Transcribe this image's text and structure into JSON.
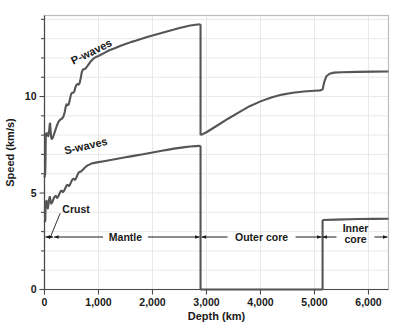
{
  "chart_data": {
    "type": "line",
    "title": "",
    "xlabel": "Depth (km)",
    "ylabel": "Speed (km/s)",
    "xlim": [
      0,
      6371
    ],
    "ylim": [
      0,
      14.2
    ],
    "grid": true,
    "legend": "inline-curve-labels",
    "x_ticks": [
      {
        "value": 0,
        "label": "0"
      },
      {
        "value": 1000,
        "label": "1,000"
      },
      {
        "value": 2000,
        "label": "2,000"
      },
      {
        "value": 3000,
        "label": "3,000"
      },
      {
        "value": 4000,
        "label": "4,000"
      },
      {
        "value": 5000,
        "label": "5,000"
      },
      {
        "value": 6000,
        "label": "6,000"
      }
    ],
    "y_ticks": [
      {
        "value": 0,
        "label": "0"
      },
      {
        "value": 1,
        "label": ""
      },
      {
        "value": 2,
        "label": ""
      },
      {
        "value": 3,
        "label": ""
      },
      {
        "value": 4,
        "label": ""
      },
      {
        "value": 5,
        "label": "5"
      },
      {
        "value": 6,
        "label": ""
      },
      {
        "value": 7,
        "label": ""
      },
      {
        "value": 8,
        "label": ""
      },
      {
        "value": 9,
        "label": ""
      },
      {
        "value": 10,
        "label": "10"
      },
      {
        "value": 11,
        "label": ""
      },
      {
        "value": 12,
        "label": ""
      },
      {
        "value": 13,
        "label": ""
      },
      {
        "value": 14,
        "label": ""
      }
    ],
    "series": [
      {
        "name": "P-waves",
        "label": "P-waves",
        "color": "#555555",
        "label_x": 900,
        "label_y": 12.15,
        "label_rotation": -26,
        "segments": [
          {
            "region": "crust-mantle",
            "points": [
              [
                0,
                5.8
              ],
              [
                12,
                6.0
              ],
              [
                18,
                6.5
              ],
              [
                22,
                7.6
              ],
              [
                26,
                8.05
              ],
              [
                40,
                8.1
              ],
              [
                55,
                8.0
              ],
              [
                70,
                7.95
              ],
              [
                85,
                8.2
              ],
              [
                96,
                8.55
              ],
              [
                104,
                8.6
              ],
              [
                112,
                8.3
              ],
              [
                122,
                7.9
              ],
              [
                134,
                7.8
              ],
              [
                150,
                7.85
              ],
              [
                170,
                8.0
              ],
              [
                200,
                8.25
              ],
              [
                230,
                8.5
              ],
              [
                260,
                8.7
              ],
              [
                290,
                8.8
              ],
              [
                320,
                8.85
              ],
              [
                350,
                8.95
              ],
              [
                375,
                9.2
              ],
              [
                395,
                9.5
              ],
              [
                410,
                9.6
              ],
              [
                430,
                9.55
              ],
              [
                450,
                9.6
              ],
              [
                470,
                9.85
              ],
              [
                490,
                10.1
              ],
              [
                510,
                10.2
              ],
              [
                530,
                10.2
              ],
              [
                550,
                10.25
              ],
              [
                570,
                10.45
              ],
              [
                590,
                10.6
              ],
              [
                610,
                10.65
              ],
              [
                630,
                10.62
              ],
              [
                650,
                10.7
              ],
              [
                670,
                10.95
              ],
              [
                690,
                11.25
              ],
              [
                710,
                11.4
              ],
              [
                730,
                11.42
              ],
              [
                760,
                11.45
              ],
              [
                800,
                11.6
              ],
              [
                850,
                11.8
              ],
              [
                900,
                11.95
              ],
              [
                950,
                12.05
              ],
              [
                1000,
                12.1
              ],
              [
                1100,
                12.25
              ],
              [
                1200,
                12.4
              ],
              [
                1300,
                12.5
              ],
              [
                1400,
                12.62
              ],
              [
                1500,
                12.72
              ],
              [
                1600,
                12.82
              ],
              [
                1700,
                12.9
              ],
              [
                1800,
                13.0
              ],
              [
                1900,
                13.08
              ],
              [
                2000,
                13.16
              ],
              [
                2100,
                13.24
              ],
              [
                2200,
                13.32
              ],
              [
                2300,
                13.4
              ],
              [
                2400,
                13.47
              ],
              [
                2500,
                13.55
              ],
              [
                2600,
                13.62
              ],
              [
                2700,
                13.68
              ],
              [
                2800,
                13.72
              ],
              [
                2890,
                13.75
              ]
            ]
          },
          {
            "region": "outer-core",
            "points": [
              [
                2890,
                8.0
              ],
              [
                3000,
                8.15
              ],
              [
                3200,
                8.5
              ],
              [
                3400,
                8.85
              ],
              [
                3600,
                9.18
              ],
              [
                3800,
                9.5
              ],
              [
                4000,
                9.75
              ],
              [
                4200,
                9.95
              ],
              [
                4400,
                10.1
              ],
              [
                4600,
                10.2
              ],
              [
                4800,
                10.26
              ],
              [
                5000,
                10.3
              ],
              [
                5100,
                10.32
              ],
              [
                5150,
                10.35
              ]
            ]
          },
          {
            "region": "inner-core",
            "points": [
              [
                5150,
                10.35
              ],
              [
                5180,
                10.75
              ],
              [
                5220,
                11.05
              ],
              [
                5280,
                11.18
              ],
              [
                5360,
                11.24
              ],
              [
                5500,
                11.26
              ],
              [
                5800,
                11.28
              ],
              [
                6100,
                11.29
              ],
              [
                6371,
                11.3
              ]
            ]
          }
        ],
        "discontinuities": [
          {
            "depth": 2890,
            "from": 13.75,
            "to": 8.0,
            "name": "core-mantle-boundary"
          }
        ]
      },
      {
        "name": "S-waves",
        "label": "S-waves",
        "color": "#555555",
        "label_x": 780,
        "label_y": 7.25,
        "label_rotation": -13,
        "segments": [
          {
            "region": "crust-mantle",
            "points": [
              [
                0,
                3.5
              ],
              [
                14,
                3.55
              ],
              [
                20,
                4.3
              ],
              [
                26,
                4.55
              ],
              [
                38,
                4.6
              ],
              [
                50,
                4.35
              ],
              [
                62,
                4.2
              ],
              [
                76,
                4.45
              ],
              [
                90,
                4.75
              ],
              [
                100,
                4.8
              ],
              [
                112,
                4.6
              ],
              [
                124,
                4.45
              ],
              [
                140,
                4.5
              ],
              [
                160,
                4.65
              ],
              [
                185,
                4.8
              ],
              [
                210,
                4.85
              ],
              [
                230,
                4.75
              ],
              [
                250,
                4.8
              ],
              [
                275,
                4.95
              ],
              [
                300,
                5.1
              ],
              [
                320,
                5.12
              ],
              [
                340,
                5.05
              ],
              [
                360,
                5.1
              ],
              [
                385,
                5.25
              ],
              [
                410,
                5.4
              ],
              [
                430,
                5.42
              ],
              [
                450,
                5.36
              ],
              [
                470,
                5.42
              ],
              [
                495,
                5.58
              ],
              [
                520,
                5.72
              ],
              [
                540,
                5.74
              ],
              [
                560,
                5.68
              ],
              [
                580,
                5.74
              ],
              [
                605,
                5.9
              ],
              [
                630,
                6.05
              ],
              [
                650,
                6.1
              ],
              [
                670,
                6.1
              ],
              [
                700,
                6.18
              ],
              [
                740,
                6.3
              ],
              [
                790,
                6.42
              ],
              [
                850,
                6.5
              ],
              [
                900,
                6.55
              ],
              [
                1000,
                6.6
              ],
              [
                1100,
                6.65
              ],
              [
                1200,
                6.7
              ],
              [
                1300,
                6.75
              ],
              [
                1400,
                6.8
              ],
              [
                1500,
                6.85
              ],
              [
                1600,
                6.9
              ],
              [
                1700,
                6.95
              ],
              [
                1800,
                7.0
              ],
              [
                1900,
                7.05
              ],
              [
                2000,
                7.1
              ],
              [
                2100,
                7.15
              ],
              [
                2200,
                7.2
              ],
              [
                2300,
                7.25
              ],
              [
                2400,
                7.3
              ],
              [
                2500,
                7.34
              ],
              [
                2600,
                7.38
              ],
              [
                2700,
                7.41
              ],
              [
                2800,
                7.43
              ],
              [
                2890,
                7.45
              ]
            ]
          },
          {
            "region": "outer-core",
            "points": [
              [
                2890,
                0
              ],
              [
                5150,
                0
              ]
            ]
          },
          {
            "region": "inner-core",
            "points": [
              [
                5150,
                3.6
              ],
              [
                5400,
                3.62
              ],
              [
                5800,
                3.65
              ],
              [
                6100,
                3.66
              ],
              [
                6371,
                3.67
              ]
            ]
          }
        ],
        "discontinuities": [
          {
            "depth": 2890,
            "from": 7.45,
            "to": 0,
            "name": "core-mantle-boundary"
          },
          {
            "depth": 5150,
            "from": 0,
            "to": 3.6,
            "name": "inner-core-boundary"
          }
        ]
      }
    ],
    "annotations": [
      {
        "name": "crust",
        "label": "Crust",
        "text_x": 330,
        "text_y": 4.15,
        "span_start": 0,
        "span_end": 160,
        "leader_from_x": 290,
        "leader_from_y": 3.95,
        "leader_to_x": 110,
        "leader_to_y": 2.72
      },
      {
        "name": "mantle",
        "label": "Mantle",
        "span_start": 160,
        "span_end": 2890,
        "text_x": 1500,
        "text_y": 2.72
      },
      {
        "name": "outer-core",
        "label": "Outer core",
        "span_start": 2890,
        "span_end": 5150,
        "text_x": 4020,
        "text_y": 2.72
      },
      {
        "name": "inner-core",
        "label": "Inner core",
        "span_start": 5150,
        "span_end": 6371,
        "text_line1": "Inner",
        "text_line2": "core",
        "text_x": 5760,
        "text_y": 2.95
      }
    ],
    "layer_band_y": 2.72,
    "colors": {
      "curve": "#555555",
      "grid": "#e9e9e9",
      "frame": "#bdbdbd",
      "axis": "#4a4a4a",
      "text": "#1a1a1a",
      "background": "#ffffff"
    }
  }
}
